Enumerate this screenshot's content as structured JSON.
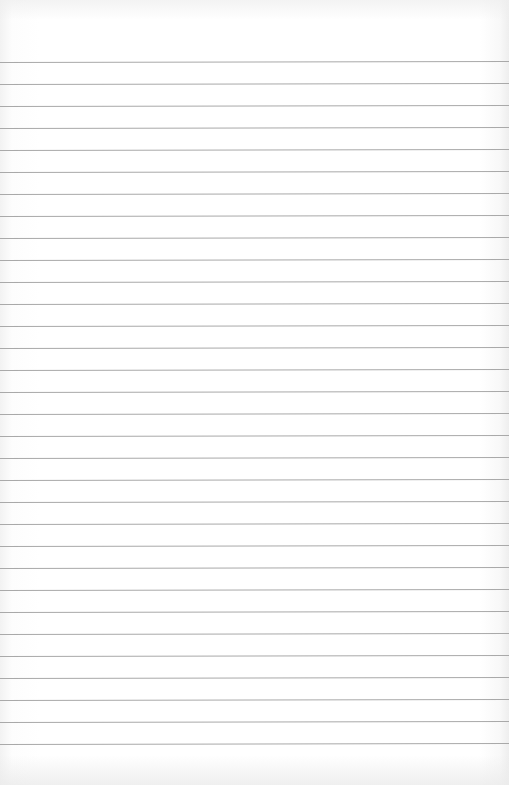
{
  "paper": {
    "type": "lined-notebook-paper",
    "background_color": "#ffffff",
    "rule_color": "#a9a9a9",
    "first_rule_y": 62,
    "rule_spacing": 22,
    "rule_count": 32
  }
}
